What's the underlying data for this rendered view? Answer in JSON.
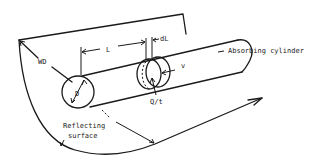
{
  "diagram": {
    "type": "schematic",
    "labels": {
      "wd": "WD",
      "l": "L",
      "dl": "dL",
      "d": "D",
      "v": "v",
      "qt": "Q/t",
      "absorbing": "Absorbing cylinder",
      "reflecting_line1": "Reflecting",
      "reflecting_line2": "surface"
    },
    "colors": {
      "line": "#1a1a1a",
      "background": "#ffffff"
    }
  }
}
